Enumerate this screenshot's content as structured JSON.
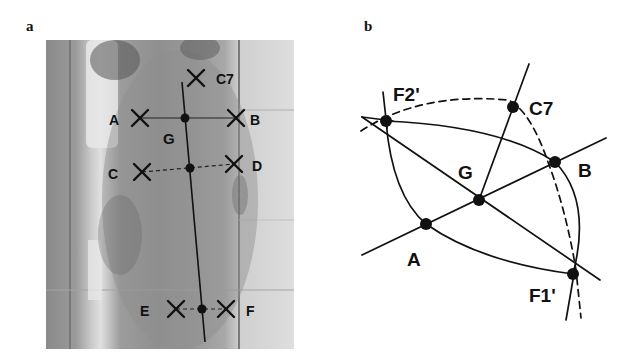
{
  "figure": {
    "panel_a": {
      "label": "a",
      "description": "Back photograph with anatomical landmarks marked",
      "landmarks": [
        {
          "name": "C7",
          "label": "C7",
          "marker": "cross",
          "x": 196,
          "y": 77
        },
        {
          "name": "A",
          "label": "A",
          "marker": "cross",
          "x": 140,
          "y": 118
        },
        {
          "name": "B",
          "label": "B",
          "marker": "cross",
          "x": 236,
          "y": 118
        },
        {
          "name": "G",
          "label": "G",
          "marker": "dot",
          "x": 185,
          "y": 118
        },
        {
          "name": "C",
          "label": "C",
          "marker": "cross",
          "x": 142,
          "y": 172
        },
        {
          "name": "D",
          "label": "D",
          "marker": "cross",
          "x": 234,
          "y": 164
        },
        {
          "name": "CD-mid",
          "label": "",
          "marker": "dot",
          "x": 190,
          "y": 168
        },
        {
          "name": "E",
          "label": "E",
          "marker": "cross",
          "x": 176,
          "y": 309
        },
        {
          "name": "F",
          "label": "F",
          "marker": "cross",
          "x": 226,
          "y": 309
        },
        {
          "name": "EF-mid",
          "label": "",
          "marker": "dot",
          "x": 202,
          "y": 309
        }
      ],
      "text_labels": {
        "C7": "C7",
        "A": "A",
        "B": "B",
        "G": "G",
        "C": "C",
        "D": "D",
        "E": "E",
        "F": "F"
      }
    },
    "panel_b": {
      "label": "b",
      "description": "Geometric construction: ellipse-like arcs through F2', B, F1', A with dashed arc through C7",
      "points": [
        {
          "name": "F2'",
          "label": "F2'",
          "x": 386,
          "y": 121
        },
        {
          "name": "C7",
          "label": "C7",
          "x": 513,
          "y": 107
        },
        {
          "name": "B",
          "label": "B",
          "x": 555,
          "y": 162
        },
        {
          "name": "G",
          "label": "G",
          "x": 479,
          "y": 200
        },
        {
          "name": "A",
          "label": "A",
          "x": 426,
          "y": 224
        },
        {
          "name": "F1'",
          "label": "F1'",
          "x": 573,
          "y": 274
        }
      ],
      "text_labels": {
        "F2p": "F2'",
        "C7": "C7",
        "G": "G",
        "B": "B",
        "A": "A",
        "F1p": "F1'"
      }
    }
  }
}
